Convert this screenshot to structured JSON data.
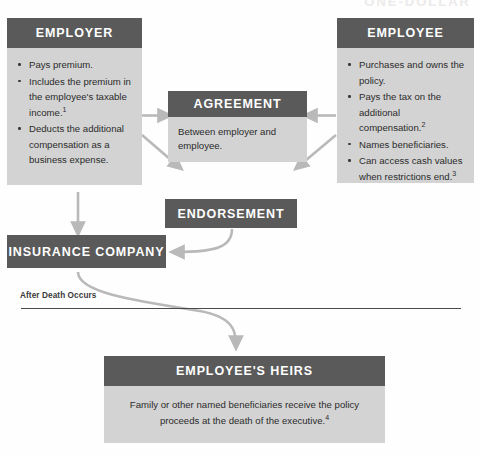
{
  "page": {
    "cut_off_header": "ONE-DOLLAR",
    "accent_dark": "#5a5a5a",
    "accent_light": "#d3d3d3",
    "arrow_color": "#b3b3b3",
    "divider_color": "#4a4a4a"
  },
  "employer": {
    "title": "EMPLOYER",
    "bullets": [
      {
        "text": "Pays premium.",
        "note": ""
      },
      {
        "text": "Includes the premium in the employee's taxable income.",
        "note": "1"
      },
      {
        "text": "Deducts the additional compensation as a business expense.",
        "note": ""
      }
    ]
  },
  "employee": {
    "title": "EMPLOYEE",
    "bullets": [
      {
        "text": "Purchases and owns the policy.",
        "note": ""
      },
      {
        "text": "Pays the tax on the additional compensation.",
        "note": "2"
      },
      {
        "text": "Names beneficiaries.",
        "note": ""
      },
      {
        "text": "Can access cash values when restrictions end.",
        "note": "3"
      }
    ]
  },
  "agreement": {
    "title": "AGREEMENT",
    "body": "Between employer and employee."
  },
  "endorsement": {
    "title": "ENDORSEMENT"
  },
  "insurance_company": {
    "title": "INSURANCE COMPANY"
  },
  "divider": {
    "label": "After Death Occurs"
  },
  "heirs": {
    "title": "EMPLOYEE'S HEIRS",
    "body": "Family or other named beneficiaries receive the policy proceeds at the death of the executive.",
    "note": "4"
  }
}
